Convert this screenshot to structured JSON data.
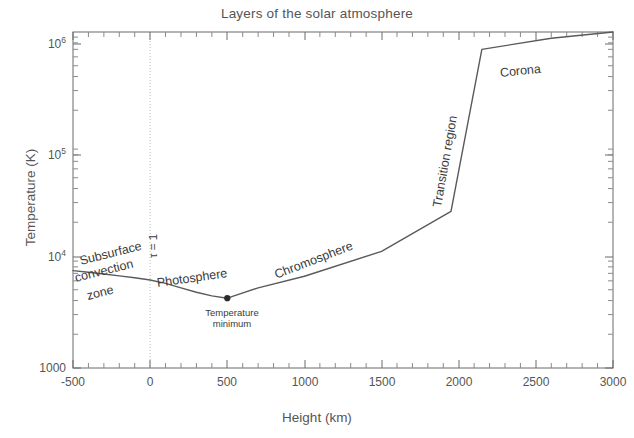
{
  "chart_data": {
    "type": "line",
    "title": "Layers of the solar atmosphere",
    "xlabel": "Height (km)",
    "ylabel": "Temperature (K)",
    "xlim": [
      -500,
      3000
    ],
    "ylim": [
      1000,
      1000000
    ],
    "yscale": "log",
    "xscale": "linear",
    "grid": false,
    "legend": "none",
    "xticks": [
      -500,
      0,
      500,
      1000,
      1500,
      2000,
      2500,
      3000
    ],
    "xtick_labels": [
      "-500",
      "0",
      "500",
      "1000",
      "1500",
      "2000",
      "2500",
      "3000"
    ],
    "yticks": [
      1000,
      10000,
      100000,
      1000000
    ],
    "ytick_labels": [
      "1000",
      "10",
      "10",
      "10"
    ],
    "ytick_exponents": [
      "",
      "4",
      "5",
      "6"
    ],
    "series": [
      {
        "name": "Solar atmosphere temperature profile",
        "x": [
          -500,
          -400,
          -300,
          -200,
          -100,
          0,
          100,
          200,
          300,
          400,
          500,
          700,
          1000,
          1500,
          1950,
          2150,
          2600,
          3000
        ],
        "y": [
          7400,
          7150,
          6900,
          6650,
          6400,
          6100,
          5700,
          5200,
          4750,
          4400,
          4200,
          5200,
          6600,
          11000,
          25000,
          700000,
          880000,
          1000000
        ]
      }
    ],
    "markers": [
      {
        "name": "temperature-minimum",
        "x": 500,
        "y": 4200,
        "label_line1": "Temperature",
        "label_line2": "minimum"
      }
    ],
    "vlines": [
      {
        "name": "tau-unity",
        "x": 0,
        "label": "τ = 1",
        "style": "dotted",
        "color": "#bbbbbb"
      }
    ],
    "annotations": [
      {
        "name": "subsurface-convection-zone",
        "text": "Subsurface\nconvection\nzone",
        "lines": [
          "Subsurface",
          "convection",
          "zone"
        ],
        "rotation": -14
      },
      {
        "name": "photosphere",
        "text": "Photosphere",
        "rotation": -8
      },
      {
        "name": "chromosphere",
        "text": "Chromosphere",
        "rotation": -21
      },
      {
        "name": "transition-region",
        "text": "Transition region",
        "rotation": -80
      },
      {
        "name": "corona",
        "text": "Corona",
        "rotation": -6
      }
    ],
    "line_color": "#5a5a5a",
    "text_color": "#555555",
    "background": "#ffffff"
  },
  "labels": {
    "title": "Layers of the solar atmosphere",
    "xlabel": "Height (km)",
    "ylabel": "Temperature (K)",
    "tau": "τ = 1",
    "tmin_line1": "Temperature",
    "tmin_line2": "minimum",
    "subsurface_l1": "Subsurface",
    "subsurface_l2": "convection",
    "subsurface_l3": "zone",
    "photosphere": "Photosphere",
    "chromosphere": "Chromosphere",
    "transition": "Transition region",
    "corona": "Corona",
    "x0": "-500",
    "x1": "0",
    "x2": "500",
    "x3": "1000",
    "x4": "1500",
    "x5": "2000",
    "x6": "2500",
    "x7": "3000",
    "y0": "1000",
    "y1": "10",
    "y2": "10",
    "y3": "10",
    "y1e": "4",
    "y2e": "5",
    "y3e": "6"
  }
}
